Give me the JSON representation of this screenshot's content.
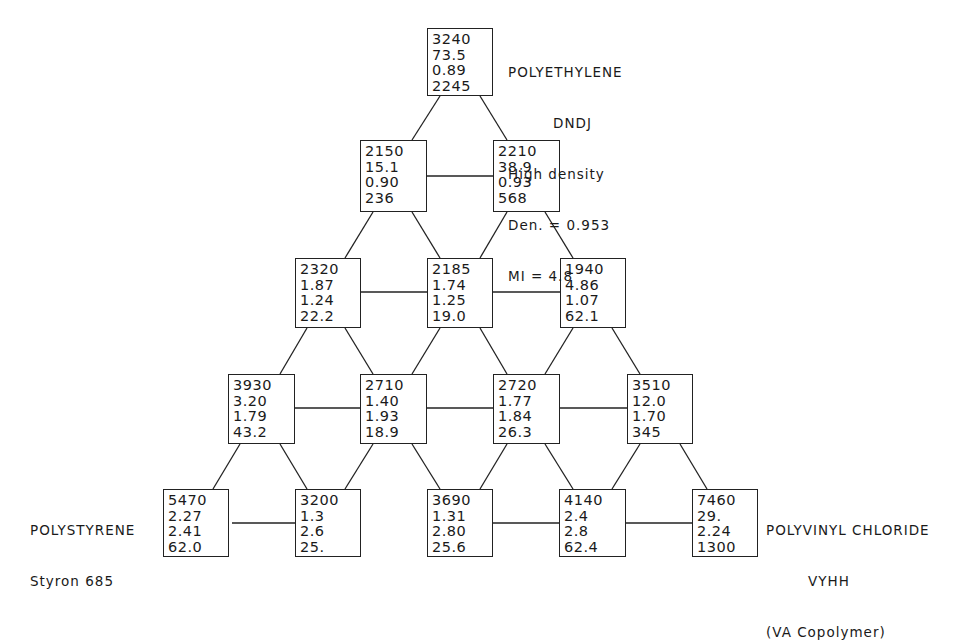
{
  "diagram": {
    "type": "ternary-triangle-lattice",
    "labels": {
      "top": {
        "lines": [
          "POLYETHYLENE",
          "DNDJ",
          "High density",
          "Den. = 0.953",
          "MI = 4.8"
        ]
      },
      "left": {
        "lines": [
          "POLYSTYRENE",
          "Styron 685"
        ]
      },
      "right": {
        "lines": [
          "POLYVINYL CHLORIDE",
          "VYHH",
          "(VA Copolymer)"
        ]
      }
    },
    "rows": [
      [
        {
          "values": [
            "3240",
            "73.5",
            "0.89",
            "2245"
          ]
        }
      ],
      [
        {
          "values": [
            "2150",
            "15.1",
            "0.90",
            "236"
          ]
        },
        {
          "values": [
            "2210",
            "38.9",
            "0.93",
            "568"
          ]
        }
      ],
      [
        {
          "values": [
            "2320",
            "1.87",
            "1.24",
            "22.2"
          ]
        },
        {
          "values": [
            "2185",
            "1.74",
            "1.25",
            "19.0"
          ]
        },
        {
          "values": [
            "1940",
            "4.86",
            "1.07",
            "62.1"
          ]
        }
      ],
      [
        {
          "values": [
            "3930",
            "3.20",
            "1.79",
            "43.2"
          ]
        },
        {
          "values": [
            "2710",
            "1.40",
            "1.93",
            "18.9"
          ]
        },
        {
          "values": [
            "2720",
            "1.77",
            "1.84",
            "26.3"
          ]
        },
        {
          "values": [
            "3510",
            "12.0",
            "1.70",
            "345"
          ]
        }
      ],
      [
        {
          "values": [
            "5470",
            "2.27",
            "2.41",
            "62.0"
          ]
        },
        {
          "values": [
            "3200",
            "1.3",
            "2.6",
            "25."
          ]
        },
        {
          "values": [
            "3690",
            "1.31",
            "2.80",
            "25.6"
          ]
        },
        {
          "values": [
            "4140",
            "2.4",
            "2.8",
            "62.4"
          ]
        },
        {
          "values": [
            "7460",
            "29.",
            "2.24",
            "1300"
          ]
        }
      ]
    ]
  }
}
